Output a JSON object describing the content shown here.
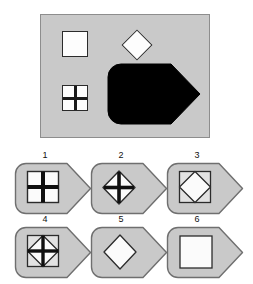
{
  "puzzle": {
    "title": "visual-analogy-shape-puzzle",
    "colors": {
      "panel_fill": "#c9c9c9",
      "panel_border": "#8d8d8d",
      "shape_fill": "#fdfdfd",
      "shape_outline": "#2b2b2b",
      "solid_black": "#000000",
      "tag_fill": "#c9c9c9",
      "tag_border": "#7a7a7a",
      "number_color": "#111111"
    },
    "stimulus": {
      "name": "stimulus-panel",
      "shapes": [
        {
          "id": "square-plain",
          "label": "white square",
          "x": 62,
          "y": 31,
          "size": 26,
          "fill": "#fdfdfd"
        },
        {
          "id": "diamond-plain",
          "label": "white diamond",
          "x": 136,
          "y": 33,
          "size": 22,
          "fill": "#fdfdfd"
        },
        {
          "id": "square-cross",
          "label": "white square with cross",
          "x": 62,
          "y": 85,
          "size": 26,
          "fill": "#fdfdfd"
        },
        {
          "id": "tag-solid-black",
          "label": "solid black tag arrow",
          "x": 118,
          "y": 77,
          "width": 76,
          "height": 50,
          "fill": "#000000"
        }
      ]
    },
    "options": [
      {
        "number": "1",
        "name": "option-1",
        "inner": "square-with-cross",
        "description": "tag containing a white square with a cross"
      },
      {
        "number": "2",
        "name": "option-2",
        "inner": "diamond-with-cross",
        "description": "tag containing a white diamond with a cross"
      },
      {
        "number": "3",
        "name": "option-3",
        "inner": "square-with-diamond",
        "description": "tag containing a white square with an inscribed diamond"
      },
      {
        "number": "4",
        "name": "option-4",
        "inner": "square-with-diamond-and-cross",
        "description": "tag containing a white square with an inscribed diamond and a cross"
      },
      {
        "number": "5",
        "name": "option-5",
        "inner": "diamond-plain",
        "description": "tag containing a plain white diamond"
      },
      {
        "number": "6",
        "name": "option-6",
        "inner": "square-plain",
        "description": "tag containing a plain white square"
      }
    ]
  }
}
